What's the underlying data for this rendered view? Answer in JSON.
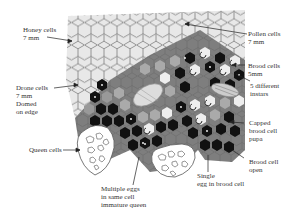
{
  "diagram": {
    "colors": {
      "honey_cells": "#e6e6e6",
      "honey_outline": "#8a8a8a",
      "pollen_cells": "#8c8c8c",
      "pollen_region": "#7a7a7a",
      "brood_dark": "#111111",
      "brood_light": "#a8a8a8",
      "larva_white": "#f2f2f2",
      "queen_cell_outline": "#555555"
    },
    "labels": {
      "honey": {
        "line1": "Honey cells",
        "line2": "7 mm"
      },
      "pollen": {
        "line1": "Pollen cells",
        "line2": "7 mm"
      },
      "drone": {
        "line1": "Drone cells",
        "line2": "7 mm",
        "line3": "Domed",
        "line4": "on edge"
      },
      "brood": {
        "line1": "Brood cells",
        "line2": "5mm"
      },
      "instars": {
        "line1": "5 different",
        "line2": "instars"
      },
      "queen": {
        "line1": "Queen cells"
      },
      "capped": {
        "line1": "Capped",
        "line2": "brood cell",
        "line3": "pupa"
      },
      "open": {
        "line1": "Brood cell",
        "line2": "open"
      },
      "multiple": {
        "line1": "Multiple eggs",
        "line2": "in same cell",
        "line3": "immature queen"
      },
      "single": {
        "line1": "Single",
        "line2": "egg in brood cell"
      }
    }
  }
}
